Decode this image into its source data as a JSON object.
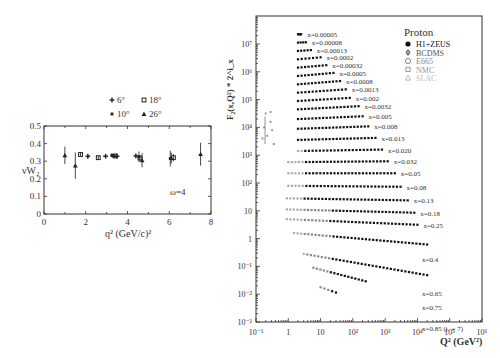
{
  "chart_data": [
    {
      "id": "left",
      "type": "scatter",
      "title": "",
      "xlabel": "q² (GeV/c)²",
      "ylabel": "νW₂",
      "xlim": [
        0,
        8
      ],
      "ylim": [
        0,
        0.5
      ],
      "xticks": [
        "0",
        "2",
        "4",
        "6",
        "8"
      ],
      "yticks": [
        "0",
        "0.1",
        "0.2",
        "0.3",
        "0.4",
        "0.5"
      ],
      "annotation": "ω=4",
      "legend": [
        {
          "label": "6°",
          "marker": "plus"
        },
        {
          "label": "18°",
          "marker": "square-open"
        },
        {
          "label": "10°",
          "marker": "cross"
        },
        {
          "label": "26°",
          "marker": "triangle"
        }
      ],
      "series": [
        {
          "name": "6°",
          "marker": "plus",
          "points": [
            [
              2.1,
              0.328,
              0.01
            ],
            [
              2.95,
              0.328,
              0.01
            ],
            [
              3.5,
              0.328,
              0.01
            ],
            [
              4.4,
              0.33,
              0.01
            ]
          ]
        },
        {
          "name": "10°",
          "marker": "cross",
          "points": [
            [
              3.25,
              0.333,
              0.012
            ],
            [
              3.35,
              0.33,
              0.01
            ],
            [
              4.55,
              0.325,
              0.03
            ],
            [
              6.05,
              0.315,
              0.045
            ]
          ]
        },
        {
          "name": "18°",
          "marker": "square-open",
          "points": [
            [
              1.75,
              0.338,
              0.01
            ],
            [
              2.6,
              0.32,
              0.01
            ],
            [
              3.4,
              0.33,
              0.01
            ],
            [
              4.6,
              0.318,
              0.015
            ],
            [
              6.2,
              0.32,
              0.02
            ]
          ]
        },
        {
          "name": "26°",
          "marker": "triangle",
          "points": [
            [
              1.0,
              0.333,
              0.05
            ],
            [
              1.5,
              0.275,
              0.075
            ],
            [
              4.7,
              0.305,
              0.04
            ],
            [
              6.1,
              0.318,
              0.03
            ],
            [
              7.5,
              0.34,
              0.065
            ]
          ]
        }
      ]
    },
    {
      "id": "right",
      "type": "scatter",
      "title": "Proton",
      "xlabel": "Q² (GeV²)",
      "ylabel": "F₂(x,Q²) * 2^i_x",
      "xscale": "log",
      "yscale": "log",
      "xlim": [
        0.1,
        1000000
      ],
      "ylim": [
        0.001,
        100000000
      ],
      "xticks": [
        "10⁻¹",
        "1",
        "10",
        "10²",
        "10³",
        "10⁴",
        "10⁵",
        "10⁶"
      ],
      "yticks": [
        "10⁻³",
        "10⁻²",
        "10⁻¹",
        "1",
        "10",
        "10²",
        "10³",
        "10⁴",
        "10⁵",
        "10⁶",
        "10⁷"
      ],
      "legend": [
        {
          "label": "H1+ZEUS",
          "marker": "filled-circle",
          "color": "#111111"
        },
        {
          "label": "BCDMS",
          "marker": "star",
          "color": "#555555"
        },
        {
          "label": "E665",
          "marker": "open-circle",
          "color": "#888888"
        },
        {
          "label": "NMC",
          "marker": "open-square",
          "color": "#999999"
        },
        {
          "label": "SLAC",
          "marker": "open-triangle",
          "color": "#bbbbbb"
        }
      ],
      "bins": [
        {
          "label": "x=0.00005",
          "q2_min": 2,
          "q2_max": 2.5,
          "log10_y": 7.35,
          "slope": 0.0
        },
        {
          "label": "x=0.00008",
          "q2_min": 2,
          "q2_max": 3.5,
          "log10_y": 7.05,
          "slope": 0.05
        },
        {
          "label": "x=0.00013",
          "q2_min": 2,
          "q2_max": 5,
          "log10_y": 6.75,
          "slope": 0.08
        },
        {
          "label": "x=0.0002",
          "q2_min": 2,
          "q2_max": 10,
          "log10_y": 6.45,
          "slope": 0.1
        },
        {
          "label": "x=0.00032",
          "q2_min": 2,
          "q2_max": 15,
          "log10_y": 6.15,
          "slope": 0.1
        },
        {
          "label": "x=0.0005",
          "q2_min": 2,
          "q2_max": 25,
          "log10_y": 5.85,
          "slope": 0.1
        },
        {
          "label": "x=0.0008",
          "q2_min": 2,
          "q2_max": 40,
          "log10_y": 5.55,
          "slope": 0.09
        },
        {
          "label": "x=0.0013",
          "q2_min": 2,
          "q2_max": 60,
          "log10_y": 5.25,
          "slope": 0.08
        },
        {
          "label": "x=0.002",
          "q2_min": 2,
          "q2_max": 80,
          "log10_y": 4.95,
          "slope": 0.07
        },
        {
          "label": "x=0.0032",
          "q2_min": 2,
          "q2_max": 150,
          "log10_y": 4.65,
          "slope": 0.06
        },
        {
          "label": "x=0.005",
          "q2_min": 2,
          "q2_max": 200,
          "log10_y": 4.3,
          "slope": 0.05
        },
        {
          "label": "x=0.008",
          "q2_min": 2,
          "q2_max": 300,
          "log10_y": 3.95,
          "slope": 0.04
        },
        {
          "label": "x=0.013",
          "q2_min": 2,
          "q2_max": 500,
          "log10_y": 3.55,
          "slope": 0.03
        },
        {
          "label": "x=0.020",
          "q2_min": 2,
          "q2_max": 800,
          "log10_y": 3.15,
          "slope": 0.02
        },
        {
          "label": "x=0.032",
          "q2_min": 1,
          "q2_max": 1200,
          "log10_y": 2.75,
          "slope": 0.01
        },
        {
          "label": "x=0.05",
          "q2_min": 1,
          "q2_max": 2000,
          "log10_y": 2.35,
          "slope": 0.0
        },
        {
          "label": "x=0.08",
          "q2_min": 1,
          "q2_max": 3000,
          "log10_y": 1.9,
          "slope": -0.01
        },
        {
          "label": "x=0.13",
          "q2_min": 0.9,
          "q2_max": 5000,
          "log10_y": 1.45,
          "slope": -0.02
        },
        {
          "label": "x=0.18",
          "q2_min": 0.9,
          "q2_max": 8000,
          "log10_y": 1.05,
          "slope": -0.03
        },
        {
          "label": "x=0.25",
          "q2_min": 0.9,
          "q2_max": 10000,
          "log10_y": 0.7,
          "slope": -0.05
        },
        {
          "label": "x=0.4",
          "q2_min": 1.5,
          "q2_max": 20000,
          "log10_y": 0.2,
          "slope": -0.1
        },
        {
          "label": "x=0.65",
          "q2_min": 3,
          "q2_max": 20000,
          "log10_y": -0.55,
          "slope": -0.2
        },
        {
          "label": "x=0.75",
          "q2_min": 6,
          "q2_max": 250,
          "log10_y": -1.05,
          "slope": -0.3
        },
        {
          "label": "x=0.85 (iₓ = 7)",
          "q2_min": 10,
          "q2_max": 30,
          "log10_y": -1.75,
          "slope": -0.4
        }
      ]
    }
  ]
}
